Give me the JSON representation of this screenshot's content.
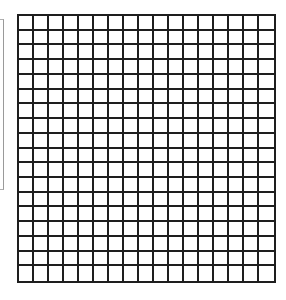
{
  "diagram": {
    "type": "square-grid",
    "columns": 17,
    "rows": 18,
    "line_color": "#1e1e1e",
    "background_color": "#ffffff",
    "cells_filled": []
  },
  "left_edge": {
    "description": "clipped neighboring panel border",
    "color": "#9a9a9a"
  }
}
